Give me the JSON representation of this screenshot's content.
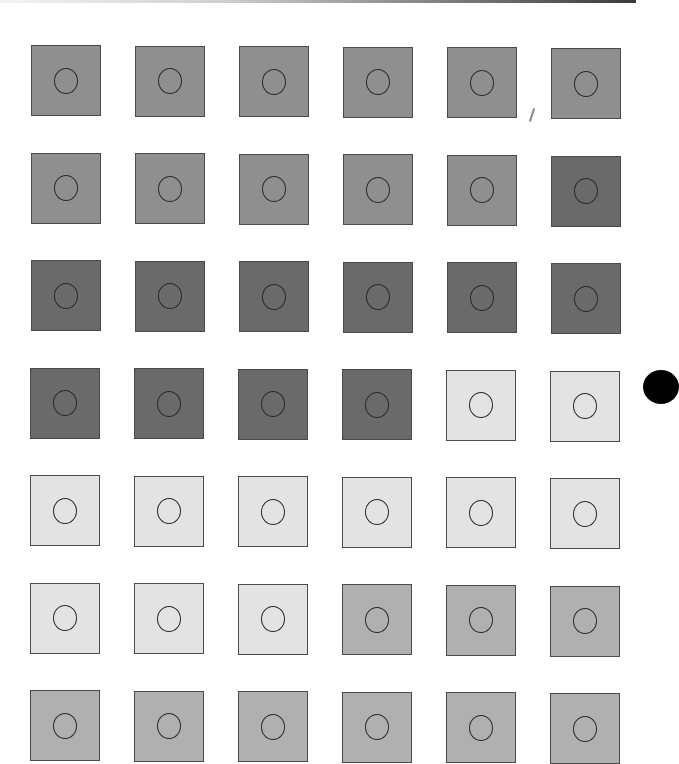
{
  "grid": {
    "rows": 7,
    "cols": 6,
    "origin": {
      "x": 31,
      "y": 45
    },
    "step": {
      "x": 104,
      "y": 107.5
    },
    "colors": {
      "medium": "#8f8f8f",
      "dark": "#6a6a6a",
      "light": "#e3e3e3",
      "midlight": "#b0b0b0"
    },
    "cells": [
      [
        "medium",
        "medium",
        "medium",
        "medium",
        "medium",
        "medium"
      ],
      [
        "medium",
        "medium",
        "medium",
        "medium",
        "medium",
        "dark"
      ],
      [
        "dark",
        "dark",
        "dark",
        "dark",
        "dark",
        "dark"
      ],
      [
        "dark",
        "dark",
        "dark",
        "dark",
        "light",
        "light"
      ],
      [
        "light",
        "light",
        "light",
        "light",
        "light",
        "light"
      ],
      [
        "light",
        "light",
        "light",
        "midlight",
        "midlight",
        "midlight"
      ],
      [
        "midlight",
        "midlight",
        "midlight",
        "midlight",
        "midlight",
        "midlight"
      ]
    ]
  },
  "decorations": {
    "top_rule": "gradient-line",
    "pencil_mark": "slash-mark",
    "bullet": "black-dot"
  }
}
